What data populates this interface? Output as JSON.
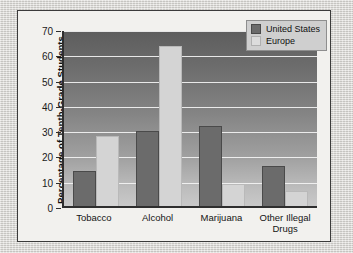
{
  "chart_data": {
    "type": "bar",
    "title": "",
    "xlabel": "",
    "ylabel": "Percentage of Tenth-Grade Students",
    "ylim": [
      0,
      70
    ],
    "yticks": [
      0,
      10,
      20,
      30,
      40,
      50,
      60,
      70
    ],
    "grid": true,
    "legend_position": "top-right",
    "categories": [
      "Tobacco",
      "Alcohol",
      "Marijuana",
      "Other Illegal Drugs"
    ],
    "category_lines": [
      [
        "Tobacco"
      ],
      [
        "Alcohol"
      ],
      [
        "Marijuana"
      ],
      [
        "Other Illegal",
        "Drugs"
      ]
    ],
    "series": [
      {
        "name": "United States",
        "color": "#6b6b6b",
        "values": [
          14,
          30,
          32,
          16
        ]
      },
      {
        "name": "Europe",
        "color": "#d4d4d4",
        "values": [
          28,
          64,
          9,
          6
        ]
      }
    ]
  },
  "legend": {
    "items": [
      {
        "label": "United States"
      },
      {
        "label": "Europe"
      }
    ]
  }
}
